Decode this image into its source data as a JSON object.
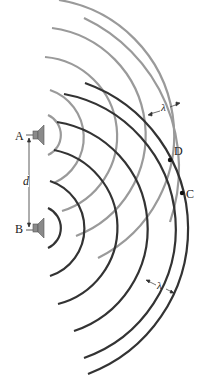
{
  "diagram": {
    "type": "two-source interference wavefronts",
    "labels": {
      "source_a": "A",
      "source_b": "B",
      "separation": "d",
      "point_c": "C",
      "point_d": "D",
      "wavelength_top": "λ",
      "wavelength_bottom": "λ"
    },
    "colors": {
      "source_a_waves": "#9a9a9a",
      "source_b_waves": "#333333",
      "speaker": "#8a8a8a",
      "text": "#222222"
    },
    "source_a_radii": [
      22,
      50,
      79,
      108,
      137,
      166
    ],
    "source_b_radii": [
      22,
      50,
      79,
      108,
      137,
      155
    ]
  }
}
